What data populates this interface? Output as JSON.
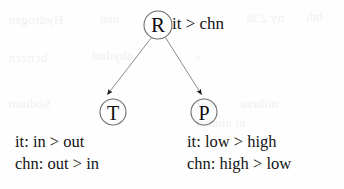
{
  "figure": {
    "type": "constraint-ranking-tree",
    "background_color": "#fefefe",
    "ink_color": "#141414",
    "edge_color": "#8c8c8c",
    "node_stroke_color": "#6e6e6e"
  },
  "nodes": {
    "root": {
      "letter": "R",
      "label": "it > chn",
      "cx": 158,
      "cy": 25,
      "r": 14
    },
    "left_child": {
      "letter": "T",
      "cx": 113,
      "cy": 112,
      "r": 13
    },
    "right_child": {
      "letter": "P",
      "cx": 204,
      "cy": 112,
      "r": 13
    }
  },
  "edges": [
    {
      "from": "R",
      "to": "T",
      "arrowhead": true
    },
    {
      "from": "R",
      "to": "P",
      "arrowhead": true
    }
  ],
  "annotations": {
    "left": {
      "lines": [
        "it: in > out",
        "chn: out > in"
      ]
    },
    "right": {
      "lines": [
        "it: low > high",
        "chn: high > low"
      ]
    }
  },
  "ghost_text": [
    {
      "text": "Hydrogen",
      "x": 8,
      "y": 12,
      "size": 13
    },
    {
      "text": "non",
      "x": 100,
      "y": 12,
      "size": 12
    },
    {
      "text": "ny 238",
      "x": 246,
      "y": 10,
      "size": 13
    },
    {
      "text": "hth",
      "x": 306,
      "y": 10,
      "size": 12
    },
    {
      "text": "bcnzcn",
      "x": 8,
      "y": 50,
      "size": 13
    },
    {
      "text": "ohydnd",
      "x": 92,
      "y": 48,
      "size": 13
    },
    {
      "text": "s",
      "x": 196,
      "y": 50,
      "size": 12
    },
    {
      "text": "Sodium",
      "x": 8,
      "y": 96,
      "size": 13
    },
    {
      "text": "ooli",
      "x": 196,
      "y": 96,
      "size": 13
    },
    {
      "text": "mihrsu",
      "x": 240,
      "y": 96,
      "size": 13
    },
    {
      "text": "ni nlunbn",
      "x": 196,
      "y": 116,
      "size": 12
    }
  ]
}
